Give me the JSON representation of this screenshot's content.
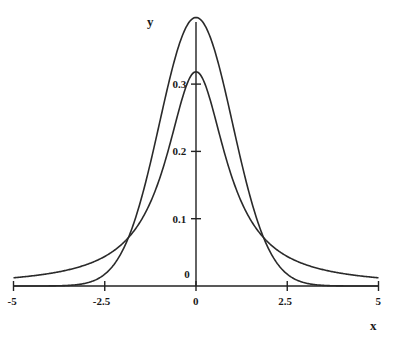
{
  "chart_data": {
    "type": "line",
    "title": "",
    "xlabel": "x",
    "ylabel": "y",
    "xlim": [
      -5,
      5
    ],
    "ylim": [
      0,
      0.4
    ],
    "grid": false,
    "legend": null,
    "x_ticks": [
      {
        "value": -5,
        "label": "-5"
      },
      {
        "value": -2.5,
        "label": "-2.5"
      },
      {
        "value": 0,
        "label": "0"
      },
      {
        "value": 2.5,
        "label": "2.5"
      },
      {
        "value": 5,
        "label": "5"
      }
    ],
    "y_ticks": [
      {
        "value": 0,
        "label": "0"
      },
      {
        "value": 0.1,
        "label": "0.1"
      },
      {
        "value": 0.2,
        "label": "0.2"
      },
      {
        "value": 0.3,
        "label": "0.3"
      }
    ],
    "series": [
      {
        "name": "normal density (tall peak, light tails)",
        "peak": 0.399,
        "x": [
          -5,
          -4,
          -3,
          -2.5,
          -2,
          -1.5,
          -1,
          -0.5,
          0,
          0.5,
          1,
          1.5,
          2,
          2.5,
          3,
          4,
          5
        ],
        "values": [
          0.0,
          0.0001,
          0.0044,
          0.0175,
          0.054,
          0.1295,
          0.242,
          0.3521,
          0.3989,
          0.3521,
          0.242,
          0.1295,
          0.054,
          0.0175,
          0.0044,
          0.0001,
          0.0
        ]
      },
      {
        "name": "cauchy density (lower peak, heavy tails)",
        "peak": 0.318,
        "x": [
          -5,
          -4,
          -3,
          -2.5,
          -2,
          -1.5,
          -1,
          -0.5,
          0,
          0.5,
          1,
          1.5,
          2,
          2.5,
          3,
          4,
          5
        ],
        "values": [
          0.0122,
          0.0187,
          0.0318,
          0.0439,
          0.0637,
          0.0979,
          0.1592,
          0.2546,
          0.3183,
          0.2546,
          0.1592,
          0.0979,
          0.0637,
          0.0439,
          0.0318,
          0.0187,
          0.0122
        ]
      }
    ],
    "annotations": [
      "curves cross near x = ±1.9, y ≈ 0.066"
    ]
  },
  "layout": {
    "x_origin_px": 196,
    "x_scale_px": 36.5,
    "y_origin_px": 286,
    "y_scale_px": 673,
    "curve_color": "#2a2a2a",
    "axis_color": "#222222"
  }
}
